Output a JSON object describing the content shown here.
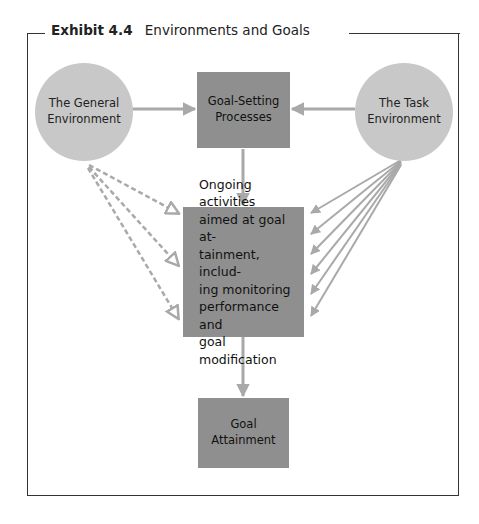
{
  "exhibit": {
    "number": "Exhibit 4.4",
    "title": "Environments and Goals"
  },
  "nodes": {
    "general_environment": "The General\nEnvironment",
    "goal_setting": "Goal-Setting\nProcesses",
    "task_environment": "The Task\nEnvironment",
    "ongoing_activities": "Ongoing activities\naimed at goal at-\ntainment, includ-\ning monitoring\nperformance and\ngoal modification",
    "goal_attainment": "Goal\nAttainment"
  },
  "edges": [
    {
      "from": "general_environment",
      "to": "goal_setting",
      "style": "solid"
    },
    {
      "from": "task_environment",
      "to": "goal_setting",
      "style": "solid"
    },
    {
      "from": "goal_setting",
      "to": "ongoing_activities",
      "style": "solid"
    },
    {
      "from": "general_environment",
      "to": "ongoing_activities",
      "style": "dashed",
      "count": 3
    },
    {
      "from": "task_environment",
      "to": "ongoing_activities",
      "style": "solid",
      "count": 6
    },
    {
      "from": "ongoing_activities",
      "to": "goal_attainment",
      "style": "solid"
    }
  ],
  "colors": {
    "circle_fill": "#c8c8c8",
    "box_fill": "#8f8f8f",
    "arrow": "#a9a9a9",
    "frame": "#333333"
  }
}
